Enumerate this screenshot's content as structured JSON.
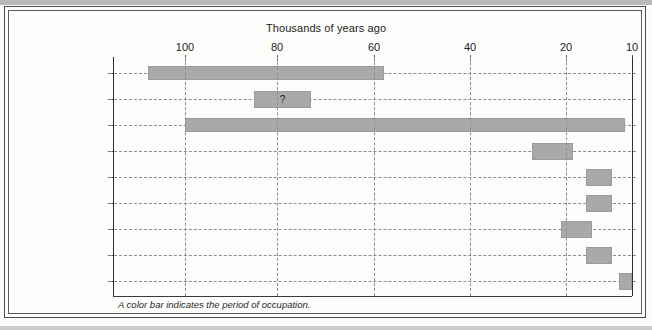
{
  "figure": {
    "background_color": "#fbfbfa",
    "bar_color": "#a9a9a9",
    "footnote": "A color bar indicates the period of occupation."
  },
  "chart_data": {
    "type": "bar",
    "orientation": "horizontal",
    "title": "Thousands of years ago",
    "xlabel": "Thousands of years ago",
    "ylabel": "",
    "x_axis_position": "top",
    "x_axis_reversed": true,
    "xlim": [
      105,
      10
    ],
    "xticks": [
      100,
      80,
      60,
      40,
      20,
      10
    ],
    "xtick_labels": [
      "100",
      "80",
      "60",
      "40",
      "20",
      "10"
    ],
    "grid": "both-dashed",
    "legend": "none",
    "categories": [
      "Klasies River Mouth",
      "Neander Valley",
      "Shanidar",
      "Dolni Vestonice",
      "Lascaux",
      "Pincevent",
      "Lake Mungo",
      "Monte Verde",
      "Lindenmeier"
    ],
    "bars": [
      {
        "category": "Klasies River Mouth",
        "start": 108,
        "end": 58,
        "label": ""
      },
      {
        "category": "Neander Valley",
        "start": 85,
        "end": 73,
        "label": "?"
      },
      {
        "category": "Shanidar",
        "start": 100,
        "end": 11,
        "label": ""
      },
      {
        "category": "Dolni Vestonice",
        "start": 27,
        "end": 19,
        "label": ""
      },
      {
        "category": "Lascaux",
        "start": 17,
        "end": 13,
        "label": ""
      },
      {
        "category": "Pincevent",
        "start": 17,
        "end": 13,
        "label": ""
      },
      {
        "category": "Lake Mungo",
        "start": 21,
        "end": 16,
        "label": ""
      },
      {
        "category": "Monte Verde",
        "start": 17,
        "end": 13,
        "label": ""
      },
      {
        "category": "Lindenmeier",
        "start": 12,
        "end": 10,
        "label": ""
      }
    ],
    "annotations": [
      {
        "text": "?",
        "category": "Neander Valley"
      }
    ]
  }
}
